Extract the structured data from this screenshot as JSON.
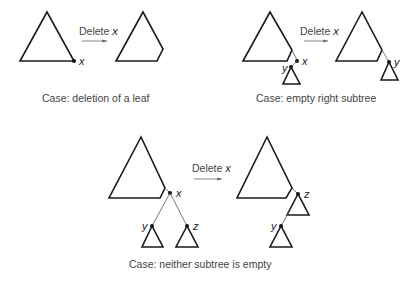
{
  "diagram": {
    "operation_label": "Delete",
    "operation_var": "x",
    "cases": [
      {
        "id": "leaf",
        "caption": "Case: deletion of a leaf",
        "before_labels": {
          "x": "x"
        },
        "after_labels": {}
      },
      {
        "id": "empty-right",
        "caption": "Case: empty right subtree",
        "before_labels": {
          "x": "x",
          "y": "y"
        },
        "after_labels": {
          "y": "y"
        }
      },
      {
        "id": "neither-empty",
        "caption": "Case: neither subtree is empty",
        "before_labels": {
          "x": "x",
          "y": "y",
          "z": "z"
        },
        "after_labels": {
          "z": "z",
          "y": "y"
        }
      }
    ]
  },
  "colors": {
    "stroke": "#1a1a1a",
    "edge": "#555555",
    "text": "#444444",
    "background": "#ffffff"
  }
}
